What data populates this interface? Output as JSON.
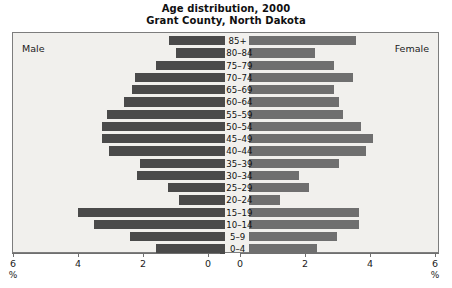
{
  "chart_data": {
    "type": "bar",
    "title": "Age distribution, 2000",
    "subtitle": "Grant County, North Dakota",
    "xlabel": "%",
    "ylabel": "",
    "xlim": [
      0,
      6
    ],
    "grid": false,
    "legend_position": "inline-plot-corners",
    "categories": [
      "85+",
      "80–84",
      "75–79",
      "70–74",
      "65–69",
      "60–64",
      "55–59",
      "50–54",
      "45–49",
      "40–44",
      "35–39",
      "30–34",
      "25–29",
      "20–24",
      "15–19",
      "10–14",
      "5–9",
      "0–4"
    ],
    "series": [
      {
        "name": "Male",
        "side": "left",
        "color": "#4a4a4a",
        "values": [
          1.7,
          1.5,
          2.1,
          2.75,
          2.85,
          3.1,
          3.6,
          3.75,
          3.75,
          3.55,
          2.6,
          2.7,
          1.75,
          1.4,
          4.5,
          4.0,
          2.9,
          2.1
        ]
      },
      {
        "name": "Female",
        "side": "right",
        "color": "#6f6f6f",
        "values": [
          3.4,
          2.1,
          2.7,
          3.3,
          2.7,
          2.85,
          3.0,
          3.55,
          3.95,
          3.7,
          2.85,
          1.6,
          1.9,
          1.0,
          3.5,
          3.5,
          2.8,
          2.15
        ]
      }
    ],
    "axis_left": {
      "ticks": [
        6,
        4,
        2,
        0
      ],
      "unit": "%"
    },
    "axis_right": {
      "ticks": [
        0,
        2,
        4,
        6
      ],
      "unit": "%"
    }
  },
  "labels": {
    "male": "Male",
    "female": "Female",
    "percent": "%"
  }
}
